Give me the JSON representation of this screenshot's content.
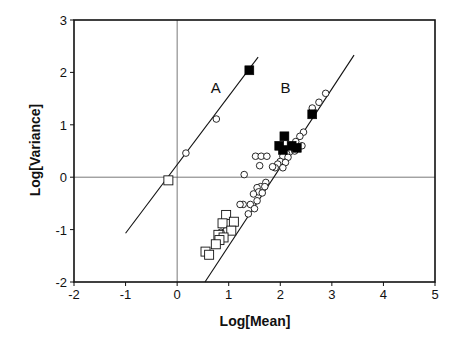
{
  "chart_data": {
    "type": "scatter",
    "title": "",
    "xlabel": "Log[Mean]",
    "ylabel": "Log[Variance]",
    "xlim": [
      -2,
      5
    ],
    "ylim": [
      -2,
      3
    ],
    "xticks": [
      "-2",
      "-1",
      "0",
      "1",
      "2",
      "3",
      "4",
      "5"
    ],
    "yticks": [
      "-2",
      "-1",
      "0",
      "1",
      "2",
      "3"
    ],
    "grid": false,
    "reference_lines": [
      {
        "orientation": "vertical",
        "x": 0
      },
      {
        "orientation": "horizontal",
        "y": 0
      }
    ],
    "annotations": [
      {
        "text": "A",
        "x": 0.75,
        "y": 1.6
      },
      {
        "text": "B",
        "x": 2.1,
        "y": 1.6
      }
    ],
    "fit_lines": [
      {
        "name": "A",
        "x": [
          -1.0,
          1.57
        ],
        "y": [
          -1.07,
          2.29
        ]
      },
      {
        "name": "B",
        "x": [
          0.54,
          3.43
        ],
        "y": [
          -2.0,
          2.33
        ]
      }
    ],
    "series": [
      {
        "name": "A open circles",
        "marker": "open-circle",
        "points": [
          [
            0.17,
            0.46
          ],
          [
            0.76,
            1.11
          ]
        ]
      },
      {
        "name": "A open squares",
        "marker": "open-square",
        "points": [
          [
            -0.17,
            -0.06
          ]
        ]
      },
      {
        "name": "A filled squares",
        "marker": "filled-square",
        "points": [
          [
            1.4,
            2.04
          ]
        ]
      },
      {
        "name": "B open circles",
        "marker": "open-circle",
        "points": [
          [
            2.88,
            1.6
          ],
          [
            2.75,
            1.43
          ],
          [
            2.62,
            1.32
          ],
          [
            2.45,
            0.86
          ],
          [
            2.38,
            0.78
          ],
          [
            2.3,
            0.68
          ],
          [
            2.42,
            0.6
          ],
          [
            2.25,
            0.55
          ],
          [
            2.18,
            0.48
          ],
          [
            2.12,
            0.45
          ],
          [
            2.05,
            0.4
          ],
          [
            2.15,
            0.38
          ],
          [
            2.28,
            0.5
          ],
          [
            2.0,
            0.3
          ],
          [
            1.95,
            0.25
          ],
          [
            2.1,
            0.28
          ],
          [
            1.9,
            0.18
          ],
          [
            1.85,
            0.2
          ],
          [
            2.05,
            0.18
          ],
          [
            1.52,
            0.4
          ],
          [
            1.63,
            0.4
          ],
          [
            1.74,
            0.4
          ],
          [
            1.6,
            0.22
          ],
          [
            1.3,
            0.05
          ],
          [
            1.72,
            -0.1
          ],
          [
            1.62,
            -0.18
          ],
          [
            1.55,
            -0.2
          ],
          [
            1.7,
            -0.18
          ],
          [
            1.58,
            -0.28
          ],
          [
            1.48,
            -0.32
          ],
          [
            1.65,
            -0.3
          ],
          [
            1.55,
            -0.45
          ],
          [
            1.42,
            -0.52
          ],
          [
            1.28,
            -0.52
          ],
          [
            1.22,
            -0.52
          ],
          [
            1.38,
            -0.7
          ],
          [
            1.5,
            -0.6
          ],
          [
            0.95,
            -1.02
          ],
          [
            0.85,
            -1.05
          ]
        ]
      },
      {
        "name": "B open squares",
        "marker": "open-square",
        "points": [
          [
            0.95,
            -0.72
          ],
          [
            1.1,
            -0.85
          ],
          [
            0.88,
            -0.88
          ],
          [
            1.05,
            -1.02
          ],
          [
            0.8,
            -1.1
          ],
          [
            0.9,
            -1.15
          ],
          [
            0.82,
            -1.2
          ],
          [
            0.75,
            -1.28
          ],
          [
            0.55,
            -1.42
          ],
          [
            0.62,
            -1.48
          ]
        ]
      },
      {
        "name": "B filled squares",
        "marker": "filled-square",
        "points": [
          [
            2.62,
            1.2
          ],
          [
            2.08,
            0.78
          ],
          [
            1.98,
            0.6
          ],
          [
            2.05,
            0.52
          ],
          [
            2.22,
            0.6
          ],
          [
            2.32,
            0.56
          ]
        ]
      }
    ]
  }
}
